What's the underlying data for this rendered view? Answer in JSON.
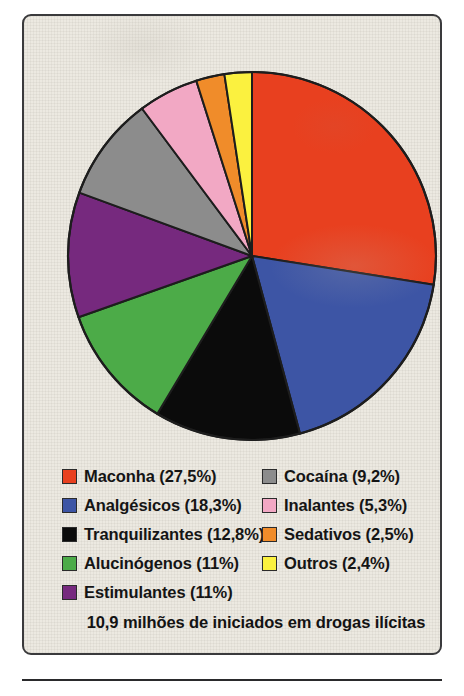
{
  "chart_data": {
    "type": "pie",
    "title": "",
    "caption": "10,9 milhões de iniciados em drogas ilícitas",
    "start_angle_deg": 0,
    "direction": "clockwise",
    "legend_position": "bottom",
    "grid": false,
    "units": "percent",
    "total_label": "10,9 milhões de iniciados em drogas ilícitas",
    "categories": [
      "Maconha",
      "Analgésicos",
      "Tranquilizantes",
      "Alucinógenos",
      "Estimulantes",
      "Cocaína",
      "Inalantes",
      "Sedativos",
      "Outros"
    ],
    "values": [
      27.5,
      18.3,
      12.8,
      11,
      11,
      9.2,
      5.3,
      2.5,
      2.4
    ],
    "value_labels": [
      "27,5%",
      "18,3%",
      "12,8%",
      "11%",
      "11%",
      "9,2%",
      "5,3%",
      "2,5%",
      "2,4%"
    ],
    "colors": [
      "#e8401f",
      "#3d55a5",
      "#0b0b0b",
      "#4cab48",
      "#76297e",
      "#8c8c8c",
      "#f2a8c4",
      "#f08c2a",
      "#fbf13f"
    ],
    "slices": [
      {
        "label": "Maconha",
        "value": 27.5,
        "value_label": "27,5%",
        "color": "#e8401f"
      },
      {
        "label": "Analgésicos",
        "value": 18.3,
        "value_label": "18,3%",
        "color": "#3d55a5"
      },
      {
        "label": "Tranquilizantes",
        "value": 12.8,
        "value_label": "12,8%",
        "color": "#0b0b0b"
      },
      {
        "label": "Alucinógenos",
        "value": 11,
        "value_label": "11%",
        "color": "#4cab48"
      },
      {
        "label": "Estimulantes",
        "value": 11,
        "value_label": "11%",
        "color": "#76297e"
      },
      {
        "label": "Cocaína",
        "value": 9.2,
        "value_label": "9,2%",
        "color": "#8c8c8c"
      },
      {
        "label": "Inalantes",
        "value": 5.3,
        "value_label": "5,3%",
        "color": "#f2a8c4"
      },
      {
        "label": "Sedativos",
        "value": 2.5,
        "value_label": "2,5%",
        "color": "#f08c2a"
      },
      {
        "label": "Outros",
        "value": 2.4,
        "value_label": "2,4%",
        "color": "#fbf13f"
      }
    ]
  },
  "legend": {
    "column_left": [
      {
        "label": "Maconha (27,5%)",
        "color": "#e8401f"
      },
      {
        "label": "Analgésicos (18,3%)",
        "color": "#3d55a5"
      },
      {
        "label": "Tranquilizantes (12,8%)",
        "color": "#0b0b0b"
      },
      {
        "label": "Alucinógenos (11%)",
        "color": "#4cab48"
      },
      {
        "label": "Estimulantes (11%)",
        "color": "#76297e"
      }
    ],
    "column_right": [
      {
        "label": "Cocaína (9,2%)",
        "color": "#8c8c8c"
      },
      {
        "label": "Inalantes (5,3%)",
        "color": "#f2a8c4"
      },
      {
        "label": "Sedativos (2,5%)",
        "color": "#f08c2a"
      },
      {
        "label": "Outros (2,4%)",
        "color": "#fbf13f"
      }
    ]
  },
  "caption": "10,9 milhões de iniciados em drogas ilícitas",
  "style": {
    "paper_color": "#ece9e1",
    "border_color": "#3a3a3c",
    "text_color": "#131313",
    "slice_outline": "#1d1d1d"
  }
}
